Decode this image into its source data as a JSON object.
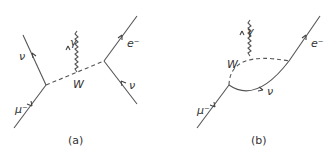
{
  "figure": {
    "panels": [
      {
        "id": "a",
        "caption": "(a)",
        "particles": {
          "muon": "μ⁻",
          "neutrino_out": "ν",
          "photon": "γ",
          "w_boson": "W",
          "electron": "e⁻",
          "neutrino_in": "ν"
        }
      },
      {
        "id": "b",
        "caption": "(b)",
        "particles": {
          "muon": "μ⁻",
          "photon": "γ",
          "w_boson": "W",
          "neutrino": "ν",
          "electron": "e⁻"
        }
      }
    ],
    "colors": {
      "line": "#555555",
      "text": "#333333",
      "background": "#ffffff"
    }
  }
}
